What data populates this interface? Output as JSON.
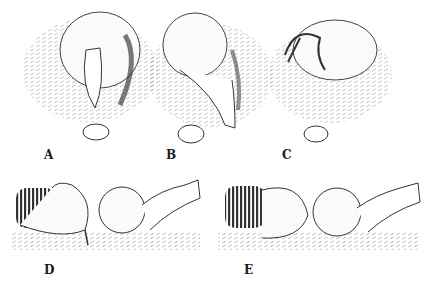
{
  "figure": {
    "panels": [
      {
        "id": "A",
        "label": "A",
        "description": "goose sitting on nest, head down facing egg in front"
      },
      {
        "id": "B",
        "label": "B",
        "description": "goose stretching neck to reach egg outside nest"
      },
      {
        "id": "C",
        "label": "C",
        "description": "goose with head tucked, egg in front of nest"
      },
      {
        "id": "D",
        "label": "D",
        "description": "side view: goose with bill at base of large egg, human hand placing egg"
      },
      {
        "id": "E",
        "label": "E",
        "description": "side view: goose rolling egg back, human hand holding egg"
      }
    ]
  }
}
